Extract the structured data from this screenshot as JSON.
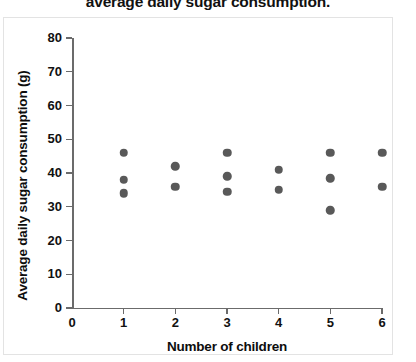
{
  "chart_data": {
    "type": "scatter",
    "title": "average daily sugar consumption.",
    "xlabel": "Number of children",
    "ylabel": "Average daily sugar consumption (g)",
    "xlim": [
      0,
      6
    ],
    "ylim": [
      0,
      80
    ],
    "xticks": [
      0,
      1,
      2,
      3,
      4,
      5,
      6
    ],
    "yticks": [
      0,
      10,
      20,
      30,
      40,
      50,
      60,
      70,
      80
    ],
    "grid": false,
    "legend": null,
    "marker_color": "#595959",
    "axis_color": "#6b6b6b",
    "points": [
      {
        "x": 1,
        "y": 46
      },
      {
        "x": 1,
        "y": 38
      },
      {
        "x": 1,
        "y": 34
      },
      {
        "x": 2,
        "y": 42
      },
      {
        "x": 2,
        "y": 36
      },
      {
        "x": 3,
        "y": 46
      },
      {
        "x": 3,
        "y": 39
      },
      {
        "x": 3,
        "y": 34.5
      },
      {
        "x": 4,
        "y": 41
      },
      {
        "x": 4,
        "y": 35
      },
      {
        "x": 5,
        "y": 46
      },
      {
        "x": 5,
        "y": 38.5
      },
      {
        "x": 5,
        "y": 29
      },
      {
        "x": 6,
        "y": 46
      },
      {
        "x": 6,
        "y": 36
      }
    ]
  }
}
